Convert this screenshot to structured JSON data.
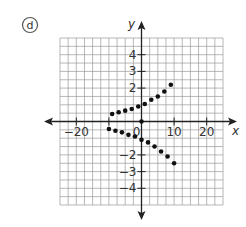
{
  "problem_label": "d",
  "colors": {
    "grid": "#9a9a9a",
    "axis": "#222222",
    "point": "#111111",
    "text": "#333333",
    "badge": "#555555"
  },
  "chart_data": {
    "type": "scatter",
    "title": "",
    "xlabel": "x",
    "ylabel": "y",
    "xlim": [
      -25,
      25
    ],
    "ylim": [
      -5,
      5
    ],
    "grid": true,
    "grid_step": {
      "x": 2.5,
      "y": 0.5
    },
    "x_ticks": [
      -20,
      -10,
      0,
      10,
      20
    ],
    "x_tick_labels": [
      "-20",
      "",
      "0",
      "10",
      "20"
    ],
    "y_ticks": [
      -4,
      -3,
      -2,
      2,
      3,
      4
    ],
    "y_tick_labels": [
      "-4",
      "-3",
      "-2",
      "2",
      "3",
      "4"
    ],
    "legend": null,
    "series": [
      {
        "name": "upper branch",
        "points": [
          [
            -9,
            0.45
          ],
          [
            -7,
            0.55
          ],
          [
            -5,
            0.65
          ],
          [
            -3,
            0.75
          ],
          [
            -1,
            0.9
          ],
          [
            1,
            1.05
          ],
          [
            3,
            1.3
          ],
          [
            5,
            1.5
          ],
          [
            7,
            1.8
          ],
          [
            9,
            2.2
          ]
        ]
      },
      {
        "name": "origin",
        "points": [
          [
            0,
            0
          ]
        ]
      },
      {
        "name": "lower branch",
        "points": [
          [
            -10,
            -0.45
          ],
          [
            -8,
            -0.55
          ],
          [
            -6,
            -0.65
          ],
          [
            -4,
            -0.8
          ],
          [
            -2,
            -0.9
          ],
          [
            0,
            -1.1
          ],
          [
            2,
            -1.25
          ],
          [
            4,
            -1.5
          ],
          [
            6,
            -1.8
          ],
          [
            8,
            -2.1
          ],
          [
            10,
            -2.5
          ]
        ]
      }
    ]
  }
}
